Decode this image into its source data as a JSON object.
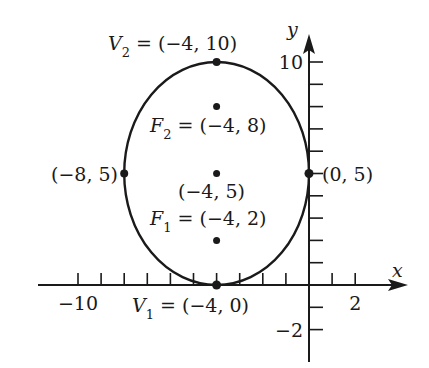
{
  "diagram": {
    "type": "ellipse-graph",
    "axes": {
      "x_label": "x",
      "y_label": "y",
      "x_tick_labels": [
        {
          "value": -10,
          "text": "−10"
        },
        {
          "value": 2,
          "text": "2"
        }
      ],
      "y_tick_labels": [
        {
          "value": 10,
          "text": "10"
        },
        {
          "value": -2,
          "text": "−2"
        }
      ],
      "x_ticks": [
        -10,
        -9,
        -8,
        -7,
        -6,
        -5,
        -4,
        -3,
        -2,
        -1,
        1,
        2
      ],
      "y_ticks": [
        -2,
        -1,
        1,
        2,
        3,
        4,
        5,
        6,
        7,
        8,
        9,
        10
      ]
    },
    "ellipse": {
      "center": [
        -4,
        5
      ],
      "semi_major": 5,
      "semi_minor": 4,
      "orientation": "vertical"
    },
    "points": [
      {
        "id": "V2",
        "coords": [
          -4,
          10
        ],
        "name": "V",
        "sub": "2",
        "text": " = (−4, 10)"
      },
      {
        "id": "F2",
        "coords": [
          -4,
          8
        ],
        "name": "F",
        "sub": "2",
        "text": " = (−4, 8)"
      },
      {
        "id": "C",
        "coords": [
          -4,
          5
        ],
        "name": "",
        "sub": "",
        "text": "(−4, 5)"
      },
      {
        "id": "F1",
        "coords": [
          -4,
          2
        ],
        "name": "F",
        "sub": "1",
        "text": " = (−4, 2)"
      },
      {
        "id": "V1",
        "coords": [
          -4,
          0
        ],
        "name": "V",
        "sub": "1",
        "text": " = (−4, 0)"
      },
      {
        "id": "L",
        "coords": [
          -8,
          5
        ],
        "name": "",
        "sub": "",
        "text": "(−8, 5)"
      },
      {
        "id": "R",
        "coords": [
          0,
          5
        ],
        "name": "",
        "sub": "",
        "text": "(0, 5)"
      }
    ],
    "colors": {
      "stroke": "#1a1a1a",
      "background": "#ffffff"
    }
  }
}
